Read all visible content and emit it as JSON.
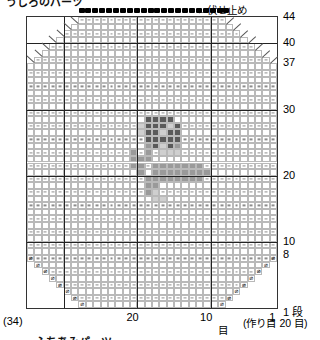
{
  "title": "うしろのパーツ",
  "bindoff": {
    "label": "←伏せ止め",
    "arrow_icon": "left-arrow-icon",
    "dot_count": 22
  },
  "chart_data": {
    "type": "heatmap",
    "title": "うしろのパーツ",
    "xlabel": "目",
    "ylabel": "段",
    "columns": 34,
    "rows": 44,
    "xlim": [
      1,
      34
    ],
    "ylim": [
      1,
      44
    ],
    "grid": true,
    "legend": "none",
    "row_labels": [
      {
        "value": "44",
        "row": 44
      },
      {
        "value": "40",
        "row": 40
      },
      {
        "value": "37",
        "row": 37
      },
      {
        "value": "30",
        "row": 30
      },
      {
        "value": "20",
        "row": 20
      },
      {
        "value": "10",
        "row": 10
      },
      {
        "value": "8",
        "row": 8
      },
      {
        "value": "1 段",
        "row": 1
      }
    ],
    "col_labels": [
      {
        "value": "20",
        "col": 20
      },
      {
        "value": "10",
        "col": 10
      },
      {
        "value": "1",
        "col": 1
      }
    ],
    "color_levels": {
      "empty": "#ffffff",
      "light": "#cfcfcf",
      "mid": "#9a9a9a",
      "dark": "#5a5a5a"
    },
    "cells": [
      {
        "row": 29,
        "col": 15,
        "level": "dark"
      },
      {
        "row": 29,
        "col": 16,
        "level": "dark"
      },
      {
        "row": 29,
        "col": 17,
        "level": "dark"
      },
      {
        "row": 29,
        "col": 18,
        "level": "dark"
      },
      {
        "row": 28,
        "col": 14,
        "level": "dark"
      },
      {
        "row": 28,
        "col": 15,
        "level": "light"
      },
      {
        "row": 28,
        "col": 16,
        "level": "dark"
      },
      {
        "row": 28,
        "col": 17,
        "level": "dark"
      },
      {
        "row": 28,
        "col": 18,
        "level": "dark"
      },
      {
        "row": 28,
        "col": 19,
        "level": "light"
      },
      {
        "row": 27,
        "col": 14,
        "level": "dark"
      },
      {
        "row": 27,
        "col": 15,
        "level": "dark"
      },
      {
        "row": 27,
        "col": 16,
        "level": "light"
      },
      {
        "row": 27,
        "col": 17,
        "level": "dark"
      },
      {
        "row": 27,
        "col": 18,
        "level": "dark"
      },
      {
        "row": 27,
        "col": 19,
        "level": "light"
      },
      {
        "row": 26,
        "col": 14,
        "level": "dark"
      },
      {
        "row": 26,
        "col": 15,
        "level": "dark"
      },
      {
        "row": 26,
        "col": 16,
        "level": "dark"
      },
      {
        "row": 26,
        "col": 17,
        "level": "dark"
      },
      {
        "row": 26,
        "col": 18,
        "level": "dark"
      },
      {
        "row": 25,
        "col": 14,
        "level": "mid"
      },
      {
        "row": 25,
        "col": 15,
        "level": "dark"
      },
      {
        "row": 25,
        "col": 16,
        "level": "light"
      },
      {
        "row": 25,
        "col": 17,
        "level": "dark"
      },
      {
        "row": 25,
        "col": 18,
        "level": "mid"
      },
      {
        "row": 24,
        "col": 14,
        "level": "light"
      },
      {
        "row": 24,
        "col": 15,
        "level": "light"
      },
      {
        "row": 24,
        "col": 16,
        "level": "light"
      },
      {
        "row": 24,
        "col": 18,
        "level": "mid"
      },
      {
        "row": 24,
        "col": 20,
        "level": "mid"
      },
      {
        "row": 23,
        "col": 18,
        "level": "mid"
      },
      {
        "row": 23,
        "col": 19,
        "level": "mid"
      },
      {
        "row": 23,
        "col": 20,
        "level": "mid"
      },
      {
        "row": 22,
        "col": 11,
        "level": "mid"
      },
      {
        "row": 22,
        "col": 12,
        "level": "mid"
      },
      {
        "row": 22,
        "col": 13,
        "level": "mid"
      },
      {
        "row": 22,
        "col": 14,
        "level": "mid"
      },
      {
        "row": 22,
        "col": 15,
        "level": "mid"
      },
      {
        "row": 22,
        "col": 16,
        "level": "mid"
      },
      {
        "row": 22,
        "col": 17,
        "level": "mid"
      },
      {
        "row": 22,
        "col": 19,
        "level": "mid"
      },
      {
        "row": 22,
        "col": 20,
        "level": "mid"
      },
      {
        "row": 21,
        "col": 10,
        "level": "mid"
      },
      {
        "row": 21,
        "col": 11,
        "level": "mid"
      },
      {
        "row": 21,
        "col": 12,
        "level": "mid"
      },
      {
        "row": 21,
        "col": 13,
        "level": "mid"
      },
      {
        "row": 21,
        "col": 14,
        "level": "mid"
      },
      {
        "row": 21,
        "col": 15,
        "level": "mid"
      },
      {
        "row": 21,
        "col": 16,
        "level": "mid"
      },
      {
        "row": 21,
        "col": 17,
        "level": "mid"
      },
      {
        "row": 21,
        "col": 19,
        "level": "mid"
      },
      {
        "row": 20,
        "col": 11,
        "level": "mid"
      },
      {
        "row": 20,
        "col": 12,
        "level": "mid"
      },
      {
        "row": 20,
        "col": 13,
        "level": "mid"
      },
      {
        "row": 20,
        "col": 14,
        "level": "mid"
      },
      {
        "row": 20,
        "col": 15,
        "level": "mid"
      },
      {
        "row": 20,
        "col": 16,
        "level": "mid"
      },
      {
        "row": 20,
        "col": 17,
        "level": "mid"
      },
      {
        "row": 20,
        "col": 18,
        "level": "mid"
      },
      {
        "row": 19,
        "col": 17,
        "level": "mid"
      },
      {
        "row": 19,
        "col": 18,
        "level": "mid"
      },
      {
        "row": 18,
        "col": 17,
        "level": "light"
      },
      {
        "row": 18,
        "col": 18,
        "level": "mid"
      },
      {
        "row": 17,
        "col": 16,
        "level": "light"
      },
      {
        "row": 17,
        "col": 17,
        "level": "light"
      }
    ]
  },
  "axis": {
    "bottom_unit": "目",
    "left_count": "(34)",
    "caston": "(作り目 20 目)",
    "first_row": "1 段"
  },
  "footer_caption": "ふちあみパーツ",
  "symbols": {
    "increase": "⌀",
    "decrease": "diagonal-decrease-line",
    "purl": "purl-dash"
  }
}
